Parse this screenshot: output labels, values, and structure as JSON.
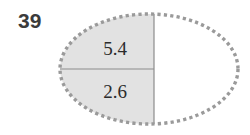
{
  "problem": {
    "number": "39"
  },
  "figure": {
    "name": "ellipse-divided-diagram",
    "shape": "ellipse",
    "outline_style": "dotted",
    "outline_color": "#9a9a9a",
    "shaded_fill_color": "#e2e2e2",
    "unshaded_fill_color": "#ffffff",
    "divider_color": "#8c8c8c",
    "regions": [
      {
        "id": "top-left",
        "label": "5.4",
        "shaded": true
      },
      {
        "id": "bottom-left",
        "label": "2.6",
        "shaded": true
      },
      {
        "id": "right",
        "label": "",
        "shaded": false
      }
    ],
    "dividers": [
      {
        "id": "vertical-chord",
        "orientation": "vertical"
      },
      {
        "id": "horizontal-chord",
        "orientation": "horizontal"
      }
    ]
  }
}
